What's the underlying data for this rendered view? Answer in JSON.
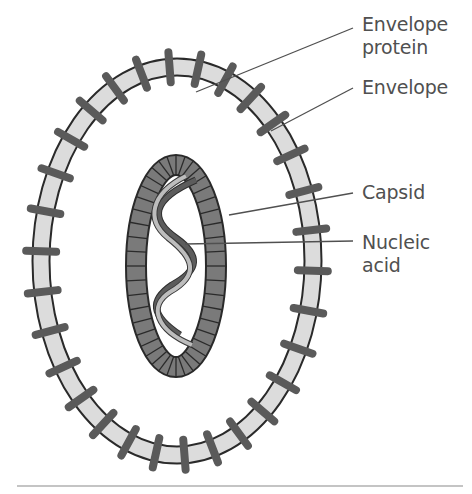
{
  "diagram": {
    "title": "",
    "labels": [
      {
        "id": "envelope-protein",
        "text_lines": [
          "Envelope",
          "protein"
        ]
      },
      {
        "id": "envelope",
        "text_lines": [
          "Envelope"
        ]
      },
      {
        "id": "capsid",
        "text_lines": [
          "Capsid"
        ]
      },
      {
        "id": "nucleic-acid",
        "text_lines": [
          "Nucleic",
          "acid"
        ]
      }
    ],
    "colors": {
      "envelope_fill": "#dcdcdc",
      "envelope_outline": "#2a2a2a",
      "protein_spikes": "#5a5a5a",
      "capsid_fill": "#7a7a7a",
      "capsid_outline": "#2a2a2a",
      "helix_dark": "#5c5c5c",
      "helix_light": "#bdbdbd",
      "leader_lines": "#505050",
      "label_text": "#505050",
      "baseline": "#8a8a8a"
    }
  }
}
